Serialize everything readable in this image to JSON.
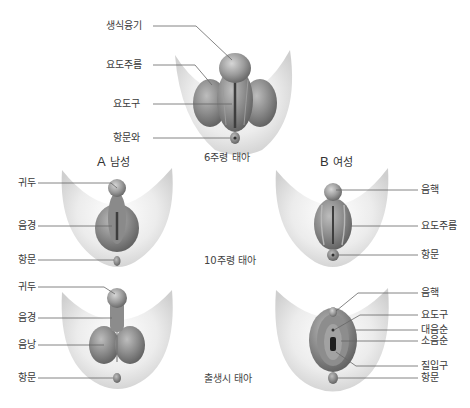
{
  "stages": {
    "week6": "6주령 태아",
    "week10": "10주령 태아",
    "birth": "출생시 태아"
  },
  "columns": {
    "male": {
      "letter": "A",
      "label": "남성"
    },
    "female": {
      "letter": "B",
      "label": "여성"
    }
  },
  "week6_labels": [
    "생식융기",
    "요도주름",
    "요도구",
    "항문와"
  ],
  "male_week10_labels": [
    "귀두",
    "음경",
    "항문"
  ],
  "male_birth_labels": [
    "귀두",
    "음경",
    "음낭",
    "항문"
  ],
  "female_week10_labels": [
    "음핵",
    "요도주름",
    "항문"
  ],
  "female_birth_labels": [
    "음핵",
    "요도구",
    "대음순",
    "소음순",
    "질입구",
    "항문"
  ],
  "colors": {
    "tissue_dark": "#6e6e6e",
    "tissue_light": "#b5b5b5",
    "skin_shadow": "#d0d0d0",
    "leader_line": "#555555",
    "label_text": "#3a3a3a"
  }
}
